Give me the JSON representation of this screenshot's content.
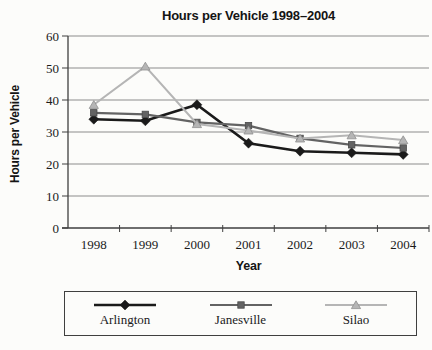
{
  "chart_data": {
    "type": "line",
    "title": "Hours per Vehicle 1998–2004",
    "xlabel": "Year",
    "ylabel": "Hours per Vehicle",
    "categories": [
      "1998",
      "1999",
      "2000",
      "2001",
      "2002",
      "2003",
      "2004"
    ],
    "series": [
      {
        "name": "Arlington",
        "marker": "diamond",
        "color": "#1a1a1a",
        "edge": "#1a1a1a",
        "line_width": 2.6,
        "values": [
          34,
          33.5,
          38.5,
          26.5,
          24,
          23.5,
          23
        ]
      },
      {
        "name": "Janesville",
        "marker": "square",
        "color": "#636363",
        "edge": "#4a4a4a",
        "line_width": 2.2,
        "values": [
          36,
          35.5,
          33,
          32,
          28,
          26,
          25
        ]
      },
      {
        "name": "Silao",
        "marker": "triangle",
        "color": "#b5b5b5",
        "edge": "#8f8f8f",
        "line_width": 2.0,
        "values": [
          38.5,
          50.5,
          32.5,
          30.5,
          28,
          29,
          27.5
        ]
      }
    ],
    "ylim": [
      0,
      60
    ],
    "y_ticks": [
      0,
      10,
      20,
      30,
      40,
      50,
      60
    ],
    "grid": true,
    "grid_color": "#8c8c8c",
    "axis_color": "#3f3f3f",
    "text_color": "#1a1a1a",
    "background": "#fcfcfa",
    "legend_position": "bottom"
  }
}
